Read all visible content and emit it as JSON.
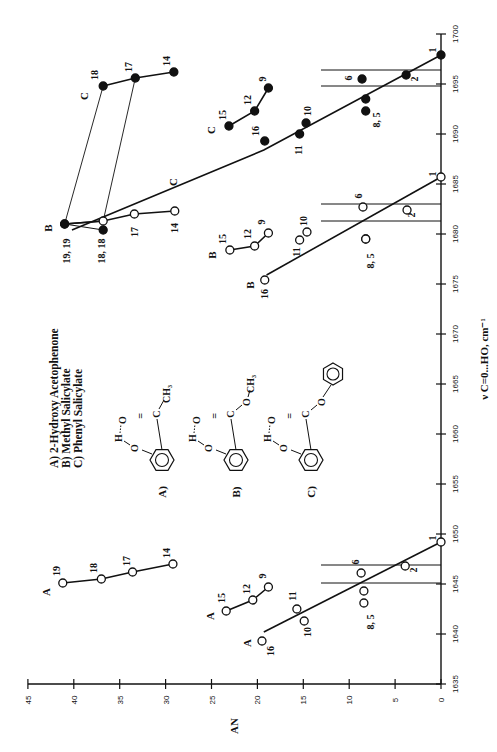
{
  "chart_data": {
    "type": "scatter",
    "orientation_note": "figure printed rotated 90 degrees counter-clockwise",
    "xlabel": "ν C=0...HO, cm⁻¹",
    "ylabel": "AN",
    "xlim": [
      1635,
      1700
    ],
    "ylim": [
      0,
      45
    ],
    "x_ticks": [
      1635,
      1640,
      1645,
      1650,
      1655,
      1660,
      1665,
      1670,
      1675,
      1680,
      1685,
      1690,
      1695,
      1700
    ],
    "y_ticks": [
      0,
      5,
      10,
      15,
      20,
      25,
      30,
      35,
      40,
      45
    ],
    "legend": [
      "A) 2-Hydroxy Acetophenone",
      "B) Methyl Salicylate",
      "C) Phenyl Salicylate"
    ],
    "structure_labels": [
      "A)",
      "B)",
      "C)"
    ],
    "series": [
      {
        "name": "A",
        "marker": "open",
        "group": "high-AN",
        "points": [
          {
            "label": "19",
            "x": 1645.1,
            "y": 41.2
          },
          {
            "label": "18",
            "x": 1645.5,
            "y": 37.0
          },
          {
            "label": "17",
            "x": 1646.2,
            "y": 33.6
          },
          {
            "label": "14",
            "x": 1647.0,
            "y": 29.2
          }
        ]
      },
      {
        "name": "A",
        "marker": "open",
        "group": "mid",
        "points": [
          {
            "label": "15",
            "x": 1642.3,
            "y": 23.4
          },
          {
            "label": "12",
            "x": 1643.4,
            "y": 20.5
          },
          {
            "label": "9",
            "x": 1644.7,
            "y": 18.8
          }
        ]
      },
      {
        "name": "A",
        "marker": "open",
        "group": "regression",
        "points": [
          {
            "label": "16",
            "x": 1639.3,
            "y": 19.5
          },
          {
            "label": "11",
            "x": 1642.5,
            "y": 15.7
          },
          {
            "label": "10",
            "x": 1641.3,
            "y": 14.9
          },
          {
            "label": "6",
            "x": 1646.1,
            "y": 8.7
          },
          {
            "label": "8",
            "x": 1644.3,
            "y": 8.4
          },
          {
            "label": "5",
            "x": 1643.1,
            "y": 8.4
          },
          {
            "label": "2",
            "x": 1646.8,
            "y": 3.9
          },
          {
            "label": "1",
            "x": 1649.2,
            "y": 0
          }
        ],
        "fit_line": [
          [
            1640.2,
            19.3
          ],
          [
            1649.2,
            0
          ]
        ],
        "bands": [
          1646.9,
          1645.1
        ]
      },
      {
        "name": "B",
        "marker": "open",
        "group": "high-AN",
        "points": [
          {
            "label": "19",
            "x": 1681.0,
            "y": 41.0
          },
          {
            "label": "18",
            "x": 1681.3,
            "y": 36.8
          },
          {
            "label": "17",
            "x": 1682.0,
            "y": 33.4
          },
          {
            "label": "14",
            "x": 1682.3,
            "y": 29.0
          }
        ]
      },
      {
        "name": "B",
        "marker": "filled",
        "group": "high-AN",
        "points": [
          {
            "label": "19",
            "x": 1681.0,
            "y": 41.0
          },
          {
            "label": "18",
            "x": 1680.4,
            "y": 36.8
          }
        ]
      },
      {
        "name": "B",
        "marker": "open",
        "group": "mid",
        "points": [
          {
            "label": "15",
            "x": 1678.4,
            "y": 23.0
          },
          {
            "label": "12",
            "x": 1678.8,
            "y": 20.3
          },
          {
            "label": "9",
            "x": 1680.1,
            "y": 18.8
          }
        ]
      },
      {
        "name": "B",
        "marker": "open",
        "group": "regression",
        "points": [
          {
            "label": "16",
            "x": 1675.4,
            "y": 19.2
          },
          {
            "label": "11",
            "x": 1679.4,
            "y": 15.4
          },
          {
            "label": "10",
            "x": 1680.2,
            "y": 14.6
          },
          {
            "label": "6",
            "x": 1682.7,
            "y": 8.5
          },
          {
            "label": "8",
            "x": 1679.5,
            "y": 8.2
          },
          {
            "label": "5",
            "x": 1679.5,
            "y": 8.2
          },
          {
            "label": "2",
            "x": 1682.4,
            "y": 3.7
          },
          {
            "label": "1",
            "x": 1685.7,
            "y": 0
          }
        ],
        "fit_line": [
          [
            1675.9,
            19.0
          ],
          [
            1685.7,
            0
          ]
        ],
        "bands": [
          1683.0,
          1681.3
        ]
      },
      {
        "name": "C",
        "marker": "filled",
        "group": "high-AN",
        "points": [
          {
            "label": "18",
            "x": 1694.8,
            "y": 36.8
          },
          {
            "label": "17",
            "x": 1695.6,
            "y": 33.3
          },
          {
            "label": "14",
            "x": 1696.2,
            "y": 29.1
          }
        ]
      },
      {
        "name": "C",
        "marker": "filled",
        "group": "mid",
        "points": [
          {
            "label": "15",
            "x": 1690.8,
            "y": 23.1
          },
          {
            "label": "12",
            "x": 1692.3,
            "y": 20.3
          },
          {
            "label": "9",
            "x": 1694.6,
            "y": 18.8
          }
        ]
      },
      {
        "name": "C",
        "marker": "filled",
        "group": "regression",
        "points": [
          {
            "label": "16",
            "x": 1689.3,
            "y": 19.2
          },
          {
            "label": "11",
            "x": 1690.0,
            "y": 15.4
          },
          {
            "label": "10",
            "x": 1691.1,
            "y": 14.7
          },
          {
            "label": "6",
            "x": 1695.5,
            "y": 8.6
          },
          {
            "label": "8",
            "x": 1693.5,
            "y": 8.2
          },
          {
            "label": "5",
            "x": 1692.3,
            "y": 8.2
          },
          {
            "label": "2",
            "x": 1695.9,
            "y": 3.8
          },
          {
            "label": "1",
            "x": 1697.9,
            "y": 0
          }
        ],
        "fit_line": [
          [
            1680.4,
            40.2
          ],
          [
            1688.4,
            19.3
          ],
          [
            1697.9,
            0
          ]
        ],
        "bands": [
          1696.4,
          1694.8
        ]
      }
    ],
    "connectors": [
      {
        "from": {
          "series": "C",
          "label": "18",
          "x": 1694.8,
          "y": 36.8
        },
        "to": {
          "series": "B",
          "label": "19",
          "x": 1681.0,
          "y": 41.0
        }
      },
      {
        "from": {
          "series": "C",
          "label": "17",
          "x": 1695.6,
          "y": 33.3
        },
        "to": {
          "series": "B",
          "label": "18",
          "x": 1681.3,
          "y": 36.8
        }
      }
    ],
    "annotations": [
      "19, 19",
      "18, 18",
      "8, 5"
    ]
  }
}
